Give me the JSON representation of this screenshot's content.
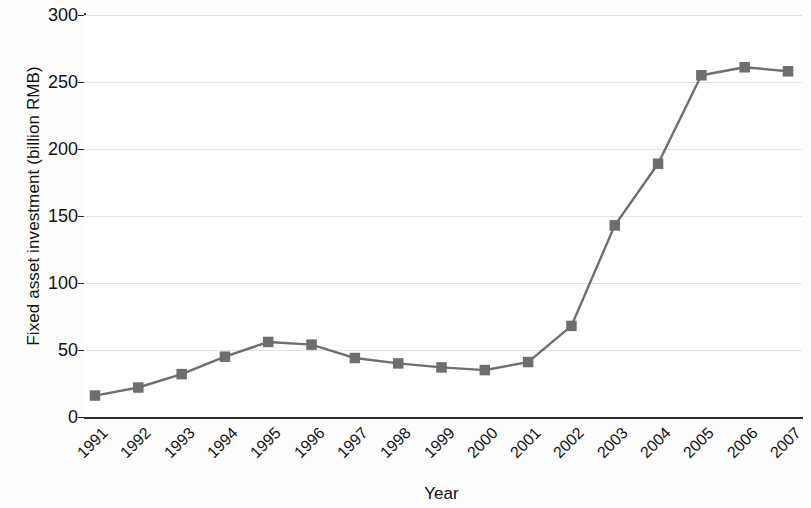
{
  "chart_data": {
    "type": "line",
    "title": "",
    "xlabel": "Year",
    "ylabel": "Fixed asset investment (billion RMB)",
    "categories": [
      "1991",
      "1992",
      "1993",
      "1994",
      "1995",
      "1996",
      "1997",
      "1998",
      "1999",
      "2000",
      "2001",
      "2002",
      "2003",
      "2004",
      "2005",
      "2006",
      "2007"
    ],
    "values": [
      16,
      22,
      32,
      45,
      56,
      54,
      44,
      40,
      37,
      35,
      41,
      68,
      143,
      189,
      255,
      261,
      258
    ],
    "series": [
      {
        "name": "Fixed asset investment",
        "values": [
          16,
          22,
          32,
          45,
          56,
          54,
          44,
          40,
          37,
          35,
          41,
          68,
          143,
          189,
          255,
          261,
          258
        ]
      }
    ],
    "ylim": [
      0,
      300
    ],
    "yticks": [
      "0",
      "50",
      "100",
      "150",
      "200",
      "250",
      "300"
    ],
    "ytick_values": [
      0,
      50,
      100,
      150,
      200,
      250,
      300
    ],
    "grid": true,
    "legend": "none",
    "marker": "square",
    "marker_color": "#6e6e6e",
    "line_color": "#6e6e6e",
    "axis_color": "#2b2b2b",
    "grid_color": "#e2e2e2",
    "xtick_rotation": -45
  }
}
